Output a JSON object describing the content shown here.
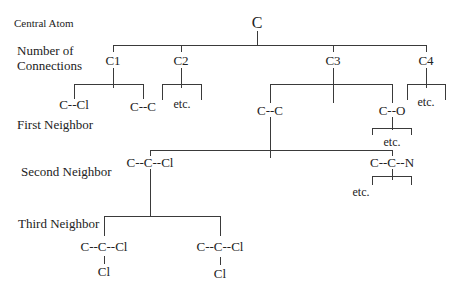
{
  "side_labels": {
    "central_atom": "Central Atom",
    "connections_line1": "Number of",
    "connections_line2": "Connections",
    "first_neighbor": "First Neighbor",
    "second_neighbor": "Second Neighbor",
    "third_neighbor": "Third Neighbor"
  },
  "tree": {
    "root": "C",
    "connections": [
      "C1",
      "C2",
      "C3",
      "C4"
    ],
    "first_neighbor": {
      "c1_left": "C--Cl",
      "c1_right": "C--C",
      "c2_etc": "etc.",
      "c3_left": "C--C",
      "c3_right": "C--O",
      "c3_right_etc": "etc.",
      "c4_etc": "etc."
    },
    "second_neighbor": {
      "left": "C--C--Cl",
      "right": "C--C--N",
      "right_etc": "etc."
    },
    "third_neighbor": {
      "left_main": "C--C--Cl",
      "left_sub": "Cl",
      "right_main": "C--C--Cl",
      "right_sub": "Cl"
    }
  },
  "colors": {
    "line": "#3a3a3a",
    "text": "#222222",
    "background": "#ffffff"
  }
}
